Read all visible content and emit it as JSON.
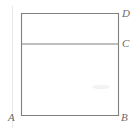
{
  "figure": {
    "kind": "geometry-diagram",
    "background_color": "#ffffff",
    "line_color": "#808080",
    "label_color": "#6b6b6b",
    "line_width": 1,
    "canvas": {
      "width": 140,
      "height": 134
    },
    "shape": {
      "name": "rectangle",
      "left": 21,
      "top": 13,
      "right": 118,
      "bottom": 115
    },
    "segments": [
      {
        "name": "top-edge",
        "x1": 21,
        "y1": 13,
        "x2": 118,
        "y2": 13
      },
      {
        "name": "right-edge",
        "x1": 118,
        "y1": 13,
        "x2": 118,
        "y2": 115
      },
      {
        "name": "bottom-edge",
        "x1": 21,
        "y1": 115,
        "x2": 118,
        "y2": 115
      },
      {
        "name": "left-edge",
        "x1": 21,
        "y1": 13,
        "x2": 21,
        "y2": 115
      },
      {
        "name": "horizontal-chord",
        "x1": 21,
        "y1": 44,
        "x2": 118,
        "y2": 44
      }
    ],
    "labels": {
      "a": "A",
      "b": "B",
      "c": "C",
      "d": "D"
    },
    "smudge": {
      "name": "scan-smudge",
      "cx": 101,
      "cy": 87,
      "rx": 9,
      "ry": 2
    }
  }
}
